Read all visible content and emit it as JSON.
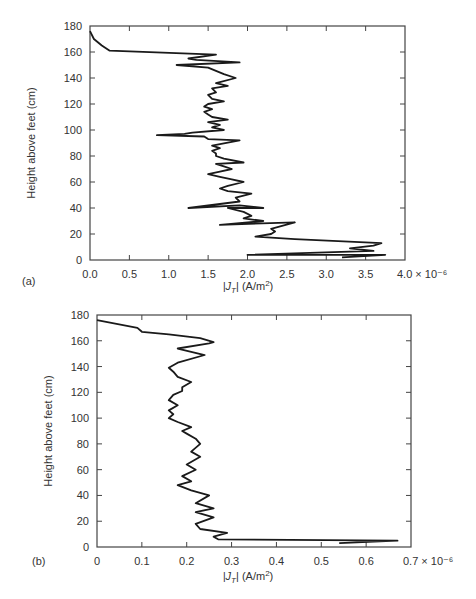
{
  "chart_data": [
    {
      "panel": "(a)",
      "type": "line",
      "title": "",
      "xlabel": "|J_T| (A/m²)",
      "ylabel": "Height above feet (cm)",
      "x_multiplier": "× 10⁻⁶",
      "xlim": [
        0.0,
        4.0
      ],
      "ylim": [
        0,
        180
      ],
      "x_ticks": [
        "0.0",
        "0.5",
        "1.0",
        "1.5",
        "2.0",
        "2.5",
        "3.0",
        "3.5",
        "4.0 × 10⁻⁶"
      ],
      "y_ticks": [
        "0",
        "20",
        "40",
        "60",
        "80",
        "100",
        "120",
        "140",
        "160",
        "180"
      ],
      "grid": false,
      "series": [
        {
          "name": "|J_T|",
          "x": [
            3.2,
            3.75,
            2.0,
            3.6,
            3.3,
            3.6,
            3.7,
            2.6,
            2.1,
            2.3,
            2.35,
            2.3,
            2.6,
            1.65,
            2.2,
            1.95,
            2.05,
            1.95,
            1.75,
            2.2,
            1.9,
            1.25,
            1.9,
            1.85,
            2.05,
            1.75,
            1.65,
            1.75,
            1.95,
            1.8,
            1.65,
            1.5,
            1.65,
            1.8,
            1.7,
            1.6,
            1.95,
            1.7,
            1.6,
            1.6,
            1.55,
            1.65,
            1.55,
            1.9,
            1.5,
            1.45,
            0.85,
            1.2,
            1.3,
            1.7,
            1.55,
            1.65,
            1.5,
            1.75,
            1.55,
            1.5,
            1.45,
            1.55,
            1.45,
            1.5,
            1.7,
            1.55,
            1.5,
            1.6,
            1.55,
            1.75,
            1.6,
            1.85,
            1.7,
            1.5,
            1.1,
            1.9,
            1.35,
            1.25,
            1.6,
            0.25,
            0.15,
            0.05,
            0.0
          ],
          "y": [
            2,
            4,
            4,
            7,
            9,
            11,
            13,
            16,
            18,
            20,
            22,
            24,
            29,
            27,
            30,
            32,
            34,
            37,
            40,
            40,
            42,
            40,
            45,
            48,
            51,
            53,
            55,
            57,
            60,
            62,
            64,
            66,
            68,
            70,
            72,
            74,
            75,
            78,
            80,
            82,
            84,
            86,
            88,
            92,
            93,
            95,
            96,
            97,
            98,
            100,
            102,
            104,
            106,
            108,
            110,
            112,
            114,
            116,
            118,
            120,
            122,
            124,
            127,
            129,
            132,
            134,
            136,
            140,
            143,
            148,
            150,
            152,
            154,
            155,
            158,
            161,
            165,
            170,
            176
          ]
        }
      ]
    },
    {
      "panel": "(b)",
      "type": "line",
      "title": "",
      "xlabel": "|J_T| (A/m²)",
      "ylabel": "Height above feet (cm)",
      "x_multiplier": "× 10⁻⁶",
      "xlim": [
        0.0,
        0.7
      ],
      "ylim": [
        0,
        180
      ],
      "x_ticks": [
        "0",
        "0.1",
        "0.2",
        "0.3",
        "0.4",
        "0.5",
        "0.6",
        "0.7 × 10⁻⁶"
      ],
      "y_ticks": [
        "0",
        "20",
        "40",
        "60",
        "80",
        "100",
        "120",
        "140",
        "160",
        "180"
      ],
      "grid": false,
      "series": [
        {
          "name": "|J_T|",
          "x": [
            0.54,
            0.67,
            0.27,
            0.26,
            0.29,
            0.23,
            0.22,
            0.26,
            0.22,
            0.26,
            0.22,
            0.25,
            0.21,
            0.18,
            0.21,
            0.19,
            0.22,
            0.2,
            0.23,
            0.21,
            0.23,
            0.22,
            0.2,
            0.19,
            0.21,
            0.18,
            0.16,
            0.17,
            0.16,
            0.18,
            0.16,
            0.17,
            0.19,
            0.19,
            0.21,
            0.18,
            0.17,
            0.16,
            0.18,
            0.24,
            0.18,
            0.25,
            0.26,
            0.23,
            0.16,
            0.1,
            0.09,
            0.0
          ],
          "y": [
            3,
            5,
            6,
            8,
            11,
            14,
            18,
            23,
            27,
            30,
            34,
            40,
            44,
            48,
            51,
            55,
            60,
            64,
            70,
            74,
            80,
            84,
            88,
            90,
            93,
            97,
            100,
            103,
            106,
            110,
            114,
            118,
            121,
            124,
            128,
            132,
            136,
            139,
            143,
            149,
            154,
            158,
            159,
            162,
            165,
            167,
            170,
            176
          ]
        }
      ]
    }
  ],
  "panels": {
    "a": {
      "label": "(a)",
      "ylabel": "Height above feet (cm)",
      "xlabel_main": "|J",
      "xlabel_sub": "T",
      "xlabel_tail": "| (A/m",
      "xlabel_sup": "2",
      "xlabel_close": ")"
    },
    "b": {
      "label": "(b)",
      "ylabel": "Height above feet (cm)",
      "xlabel_main": "|J",
      "xlabel_sub": "T",
      "xlabel_tail": "| (A/m",
      "xlabel_sup": "2",
      "xlabel_close": ")"
    }
  }
}
